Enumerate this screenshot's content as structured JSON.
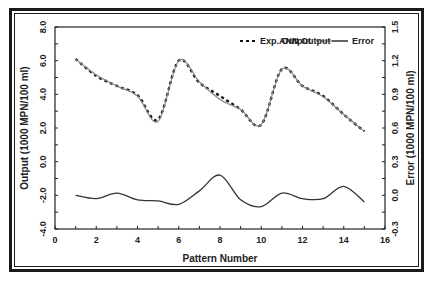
{
  "chart_data": {
    "type": "line",
    "title": "",
    "xlabel": "Pattern Number",
    "ylabel": "Output (1000 MPN/100 ml)",
    "y2label": "Error (1000 MPN/100 ml)",
    "xlim": [
      0,
      16
    ],
    "ylim": [
      -4.0,
      8.0
    ],
    "y2lim": [
      -0.3,
      1.5
    ],
    "x_ticks": [
      "0",
      "2",
      "4",
      "6",
      "8",
      "10",
      "12",
      "14",
      "16"
    ],
    "y_ticks": [
      "-4.0",
      "-2.0",
      "0.0",
      "2.0",
      "4.0",
      "6.0",
      "8.0"
    ],
    "y2_ticks": [
      "-0.3",
      "0.0",
      "0.3",
      "0.6",
      "0.9",
      "1.2",
      "1.5"
    ],
    "grid": false,
    "legend_position": "top-right inside",
    "x": [
      1,
      2,
      3,
      4,
      5,
      6,
      7,
      8,
      9,
      10,
      11,
      12,
      13,
      14,
      15
    ],
    "series": [
      {
        "name": "Exp. Output",
        "axis": "left",
        "style": "dashed",
        "values": [
          6.1,
          5.1,
          4.5,
          3.95,
          2.5,
          6.0,
          4.7,
          3.9,
          3.1,
          2.2,
          5.5,
          4.5,
          3.9,
          2.8,
          1.8
        ]
      },
      {
        "name": "ANN Output",
        "axis": "left",
        "style": "solid-gray",
        "values": [
          6.1,
          5.15,
          4.5,
          3.9,
          2.4,
          6.0,
          4.75,
          3.7,
          3.1,
          2.2,
          5.5,
          4.5,
          3.85,
          2.8,
          1.8
        ]
      },
      {
        "name": "Error",
        "axis": "right",
        "style": "solid",
        "values": [
          0.0,
          -0.03,
          0.02,
          -0.04,
          -0.05,
          -0.08,
          0.04,
          0.18,
          -0.04,
          -0.1,
          0.02,
          -0.03,
          -0.03,
          0.08,
          -0.06
        ]
      }
    ]
  },
  "legend": {
    "exp": "Exp. Output",
    "ann": "ANN Output",
    "err": "Error"
  },
  "axes": {
    "xlabel": "Pattern Number",
    "ylabel": "Output (1000 MPN/100 ml)",
    "y2label": "Error (1000 MPN/100 ml)"
  }
}
